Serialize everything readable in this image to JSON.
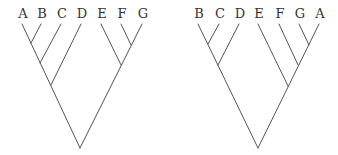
{
  "style": {
    "line_color": "#555555",
    "label_color": "#333333",
    "background": "#ffffff"
  },
  "trees": [
    {
      "name": "left-tree",
      "topology": "((((A,B),C),D),(E,(F,G)))",
      "leaves": [
        {
          "label": "A",
          "x": 22,
          "y": 24
        },
        {
          "label": "B",
          "x": 41,
          "y": 24
        },
        {
          "label": "C",
          "x": 61,
          "y": 24
        },
        {
          "label": "D",
          "x": 81,
          "y": 24
        },
        {
          "label": "E",
          "x": 101,
          "y": 24
        },
        {
          "label": "F",
          "x": 121,
          "y": 24
        },
        {
          "label": "G",
          "x": 142,
          "y": 24
        }
      ],
      "nodes": {
        "AB": [
          31,
          43
        ],
        "ABC": [
          40,
          63
        ],
        "ABCD": [
          51,
          85
        ],
        "FG": [
          131,
          45
        ],
        "EFG": [
          121,
          65
        ],
        "root": [
          80,
          148
        ]
      }
    },
    {
      "name": "right-tree",
      "topology": "(((B,C),D),(E,(F,(G,A))))",
      "leaves": [
        {
          "label": "B",
          "x": 198,
          "y": 24
        },
        {
          "label": "C",
          "x": 219,
          "y": 24
        },
        {
          "label": "D",
          "x": 239,
          "y": 24
        },
        {
          "label": "E",
          "x": 258,
          "y": 24
        },
        {
          "label": "F",
          "x": 279,
          "y": 24
        },
        {
          "label": "G",
          "x": 299,
          "y": 24
        },
        {
          "label": "A",
          "x": 319,
          "y": 24
        }
      ],
      "nodes": {
        "BC": [
          208,
          44
        ],
        "BCD": [
          218,
          65
        ],
        "GA": [
          309,
          45
        ],
        "FGA": [
          298,
          65
        ],
        "EFGA": [
          288,
          86
        ],
        "root": [
          258,
          148
        ]
      }
    }
  ]
}
